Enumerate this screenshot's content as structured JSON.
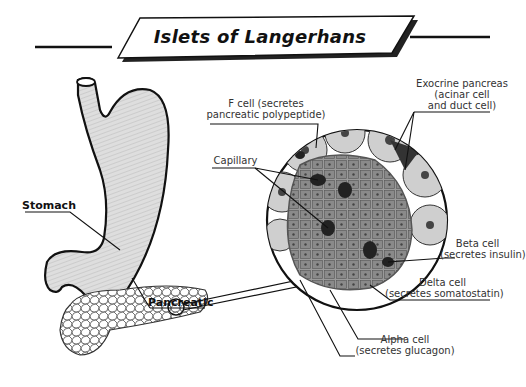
{
  "title": "Islets of Langerhans",
  "labels": {
    "f_cell": {
      "line1": "F cell (secretes",
      "line2": "pancreatic polypeptide)"
    },
    "exocrine": {
      "line1": "Exocrine pancreas",
      "line2": "(acinar cell",
      "line3": "and duct cell)"
    },
    "capillary": "Capillary",
    "beta": {
      "line1": "Beta cell",
      "line2": "(secretes insulin)"
    },
    "delta": {
      "line1": "Delta cell",
      "line2": "(secretes somatostatin)"
    },
    "alpha": {
      "line1": "Alpha cell",
      "line2": "(secretes glucagon)"
    },
    "stomach": "Stomach",
    "pancreatic": "Pancreatic"
  },
  "colors": {
    "outline": "#111111",
    "stomach_fill": "#d9d9d9",
    "islet_fill": "#8a8a8a",
    "cell_dark": "#2a2a2a",
    "acinar_fill": "#cfcfcf"
  }
}
